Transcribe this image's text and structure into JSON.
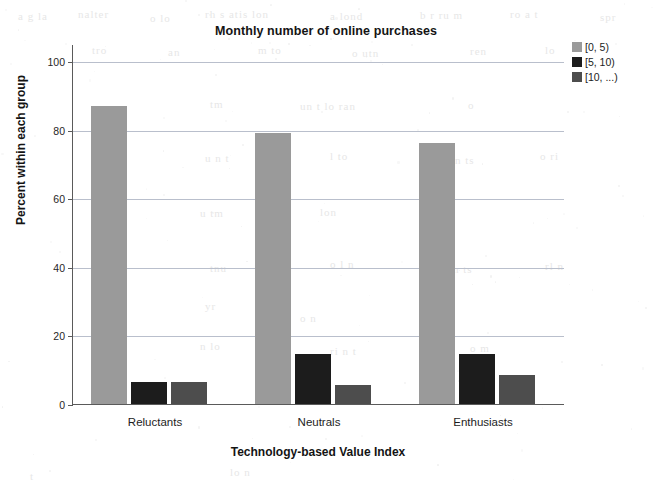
{
  "chart_data": {
    "type": "bar",
    "title": "Monthly number of online purchases",
    "xlabel": "Technology-based Value Index",
    "ylabel": "Percent within each group",
    "categories": [
      "Reluctants",
      "Neutrals",
      "Enthusiasts"
    ],
    "series": [
      {
        "name": "[0, 5)",
        "color": "#9a9a9a",
        "values": [
          87,
          79,
          76
        ]
      },
      {
        "name": "[5, 10)",
        "color": "#1c1c1c",
        "values": [
          6.5,
          14.5,
          14.5
        ]
      },
      {
        "name": "[10, ...)",
        "color": "#4d4d4d",
        "values": [
          6.5,
          5.5,
          8.5
        ]
      }
    ],
    "ylim": [
      0,
      105
    ],
    "yticks": [
      0,
      20,
      40,
      60,
      80,
      100
    ],
    "ytick_labels": [
      "0",
      "20",
      "40",
      "60",
      "80",
      "100"
    ],
    "grid": true,
    "legend_position": "top-right"
  },
  "ghosts": [
    {
      "text": "a g la",
      "x": 18,
      "y": 10
    },
    {
      "text": "nalter",
      "x": 78,
      "y": 8
    },
    {
      "text": "o lo",
      "x": 150,
      "y": 12
    },
    {
      "text": "rh s atis lon",
      "x": 205,
      "y": 8
    },
    {
      "text": "a lond",
      "x": 330,
      "y": 10
    },
    {
      "text": "b r ru m",
      "x": 420,
      "y": 9
    },
    {
      "text": "ro a  t",
      "x": 510,
      "y": 8
    },
    {
      "text": "spr",
      "x": 600,
      "y": 11
    },
    {
      "text": "tro",
      "x": 92,
      "y": 44
    },
    {
      "text": "an",
      "x": 168,
      "y": 46
    },
    {
      "text": "m to",
      "x": 258,
      "y": 44
    },
    {
      "text": "o utn",
      "x": 352,
      "y": 47
    },
    {
      "text": "ren",
      "x": 470,
      "y": 45
    },
    {
      "text": "lo",
      "x": 545,
      "y": 44
    },
    {
      "text": "tm",
      "x": 210,
      "y": 98
    },
    {
      "text": "un t lo  ran",
      "x": 300,
      "y": 100
    },
    {
      "text": "o",
      "x": 468,
      "y": 99
    },
    {
      "text": "u n  t",
      "x": 205,
      "y": 152
    },
    {
      "text": "l to",
      "x": 330,
      "y": 150
    },
    {
      "text": "n ts",
      "x": 455,
      "y": 154
    },
    {
      "text": "o ri",
      "x": 540,
      "y": 150
    },
    {
      "text": "u tm",
      "x": 200,
      "y": 207
    },
    {
      "text": "lon",
      "x": 320,
      "y": 206
    },
    {
      "text": "ris",
      "x": 440,
      "y": 210
    },
    {
      "text": "tnu",
      "x": 210,
      "y": 262
    },
    {
      "text": "o l n",
      "x": 330,
      "y": 258
    },
    {
      "text": "m  ts",
      "x": 450,
      "y": 263
    },
    {
      "text": "rl n",
      "x": 545,
      "y": 260
    },
    {
      "text": "yr",
      "x": 205,
      "y": 300
    },
    {
      "text": "o n",
      "x": 300,
      "y": 312
    },
    {
      "text": "t ur",
      "x": 430,
      "y": 305
    },
    {
      "text": "n  lo",
      "x": 200,
      "y": 340
    },
    {
      "text": "ri  n t",
      "x": 330,
      "y": 345
    },
    {
      "text": "o m",
      "x": 470,
      "y": 342
    },
    {
      "text": "t",
      "x": 30,
      "y": 470
    },
    {
      "text": "lo n",
      "x": 230,
      "y": 466
    }
  ]
}
